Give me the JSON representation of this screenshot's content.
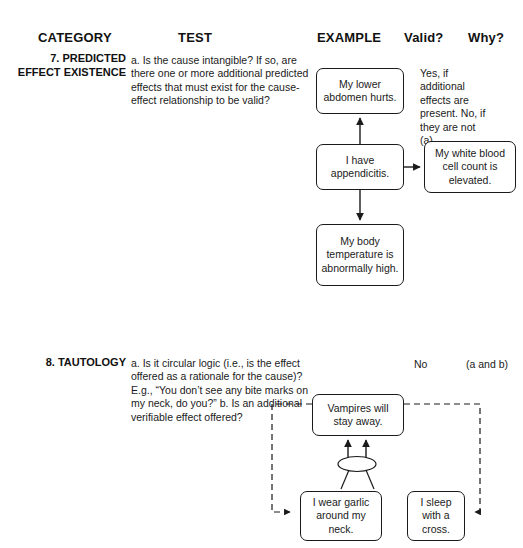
{
  "headers": {
    "category": "CATEGORY",
    "test": "TEST",
    "example": "EXAMPLE",
    "valid": "Valid?",
    "why": "Why?"
  },
  "rows": [
    {
      "category": "7. PREDICTED EFFECT EXISTENCE",
      "test": "a. Is the cause intangible? If so, are there one or more additional predicted effects that must exist for the cause-effect relationship to be valid?",
      "valid": "",
      "why": "Yes, if additional effects are present. No, if they are not (a).",
      "example": {
        "type": "cause-effect-tree",
        "boxes": [
          {
            "name": "abdomen",
            "text": "My lower abdomen hurts."
          },
          {
            "name": "appendicitis",
            "text": "I have appendicitis."
          },
          {
            "name": "wbc",
            "text": "My white blood cell count is elevated."
          },
          {
            "name": "temp",
            "text": "My body temperature is abnormally high."
          }
        ],
        "arrows": [
          {
            "from": "appendicitis",
            "to": "abdomen",
            "style": "solid"
          },
          {
            "from": "appendicitis",
            "to": "wbc",
            "style": "solid"
          },
          {
            "from": "appendicitis",
            "to": "temp",
            "style": "solid"
          }
        ]
      }
    },
    {
      "category": "8. TAUTOLOGY",
      "test": "a. Is it circular logic (i.e., is the effect offered as a rationale for the cause)? E.g., “You don’t see any bite marks on my neck, do you?” b. Is an additional verifiable effect offered?",
      "valid": "No",
      "why": "(a and b)",
      "example": {
        "type": "circular-logic-loop",
        "boxes": [
          {
            "name": "vampires",
            "text": "Vampires will stay away."
          },
          {
            "name": "garlic",
            "text": "I wear garlic around my neck."
          },
          {
            "name": "cross",
            "text": "I sleep with a cross."
          }
        ],
        "junction": "and-ellipse",
        "arrows": [
          {
            "from": "garlic",
            "to": "vampires",
            "style": "solid"
          },
          {
            "from": "cross",
            "to": "vampires",
            "style": "solid"
          },
          {
            "from": "vampires",
            "to": "garlic",
            "style": "dashed"
          },
          {
            "from": "vampires",
            "to": "cross",
            "style": "dashed"
          }
        ]
      }
    }
  ],
  "colors": {
    "ink": "#1a1a1a",
    "paper": "#ffffff"
  }
}
